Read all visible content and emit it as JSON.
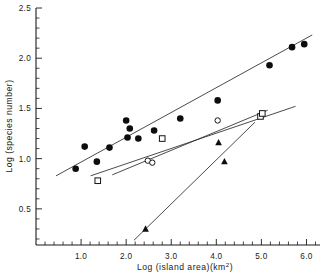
{
  "figure": {
    "background": "#ffffff",
    "ink_color": "#1a1a1a"
  },
  "chart_data": {
    "type": "scatter",
    "title": "",
    "xlabel": "Log (island area)(km2)",
    "xlabel_base": "Log (island area)(km",
    "xlabel_sup": "2",
    "xlabel_tail": ")",
    "ylabel": "Log (species number)",
    "xlim": [
      0.0,
      6.3
    ],
    "ylim": [
      0.14,
      2.5
    ],
    "grid": false,
    "legend": "none",
    "xticks": [
      1.0,
      2.0,
      3.0,
      4.0,
      5.0,
      6.0
    ],
    "xticklabels": [
      "1.0",
      "2.0",
      "3.0",
      "4.0",
      "5.0",
      "6.0"
    ],
    "xtick_minor_step": 0.2,
    "yticks": [
      0.5,
      1.0,
      1.5,
      2.0,
      2.5
    ],
    "yticklabels": [
      "0.5",
      "1.0",
      "1.5",
      "2.0",
      "2.5"
    ],
    "ytick_minor_step": 0.1,
    "series": [
      {
        "name": "filled-circle",
        "marker": "filled circle",
        "points": [
          [
            0.88,
            0.9
          ],
          [
            1.08,
            1.12
          ],
          [
            1.35,
            0.97
          ],
          [
            1.63,
            1.11
          ],
          [
            2.0,
            1.38
          ],
          [
            2.03,
            1.21
          ],
          [
            2.08,
            1.3
          ],
          [
            2.27,
            1.2
          ],
          [
            2.62,
            1.28
          ],
          [
            3.2,
            1.4
          ],
          [
            4.03,
            1.58
          ],
          [
            5.18,
            1.93
          ],
          [
            5.68,
            2.11
          ],
          [
            5.95,
            2.14
          ]
        ],
        "trendline": [
          [
            0.45,
            0.83
          ],
          [
            6.12,
            2.23
          ]
        ]
      },
      {
        "name": "open-square",
        "marker": "open square",
        "points": [
          [
            1.37,
            0.78
          ],
          [
            2.8,
            1.2
          ],
          [
            4.98,
            1.42
          ],
          [
            5.02,
            1.45
          ]
        ],
        "trendline": [
          [
            1.22,
            0.83
          ],
          [
            5.75,
            1.52
          ]
        ]
      },
      {
        "name": "open-circle",
        "marker": "open circle",
        "points": [
          [
            2.48,
            0.98
          ],
          [
            2.58,
            0.96
          ],
          [
            4.03,
            1.38
          ]
        ],
        "trendline": [
          [
            1.7,
            0.84
          ],
          [
            5.13,
            1.48
          ]
        ]
      },
      {
        "name": "filled-triangle",
        "marker": "filled triangle",
        "points": [
          [
            2.43,
            0.3
          ],
          [
            4.05,
            1.16
          ],
          [
            4.18,
            0.97
          ]
        ],
        "trendline": [
          [
            2.18,
            0.19
          ],
          [
            4.85,
            1.36
          ]
        ]
      }
    ]
  }
}
